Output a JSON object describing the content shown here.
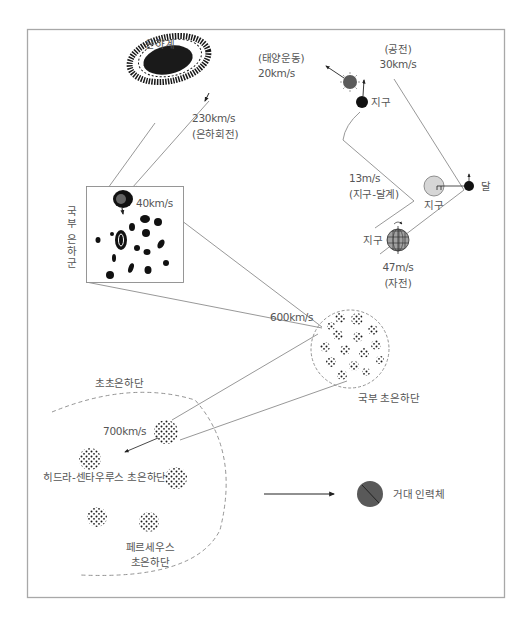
{
  "diagram": {
    "title": "",
    "colors": {
      "frame": "#a8a8a8",
      "line": "#8c8c8c",
      "text": "#555555",
      "dots": "#1a1a1a",
      "sun": "#5a5a5a",
      "earth_orbit_fill": "#d6d6d6",
      "globe_fill": "#9a9a9a",
      "attractor": "#595959"
    },
    "labels": {
      "galaxy": "은하계",
      "galaxy_rotation_speed": "230km/s",
      "galaxy_rotation_name": "(은하회전)",
      "solar_motion_name": "(태양운동)",
      "solar_motion_speed": "20km/s",
      "revolution_name": "(공전)",
      "revolution_speed": "30km/s",
      "earth_1": "지구",
      "earth_moon_speed": "13m/s",
      "earth_moon_name": "(지구-달계)",
      "earth_2": "지구",
      "moon": "달",
      "earth_3": "지구",
      "rotation_speed": "47m/s",
      "rotation_name": "(자전)",
      "local_group": "국부 은하군",
      "local_group_speed": "40km/s",
      "local_supercluster_speed": "600km/s",
      "local_supercluster": "국부 초은하단",
      "super_supercluster": "초초은하단",
      "super_supercluster_speed": "700km/s",
      "hydra_centaurus": "히드라-센타우루스 초은하단",
      "perseus_line1": "페르세우스",
      "perseus_line2": "초은하단",
      "great_attractor": "거대 인력체"
    },
    "nodes": [
      {
        "id": "milky-way",
        "label": "은하계"
      },
      {
        "id": "sun",
        "motion": "20km/s"
      },
      {
        "id": "earth-orbit",
        "motion": "30km/s"
      },
      {
        "id": "earth-moon-system",
        "motion": "13m/s"
      },
      {
        "id": "earth-rotation",
        "motion": "47m/s"
      },
      {
        "id": "local-group",
        "motion": "40km/s"
      },
      {
        "id": "local-supercluster",
        "motion": "600km/s"
      },
      {
        "id": "super-supercluster",
        "motion": "700km/s"
      },
      {
        "id": "great-attractor",
        "label": "거대 인력체"
      }
    ]
  }
}
